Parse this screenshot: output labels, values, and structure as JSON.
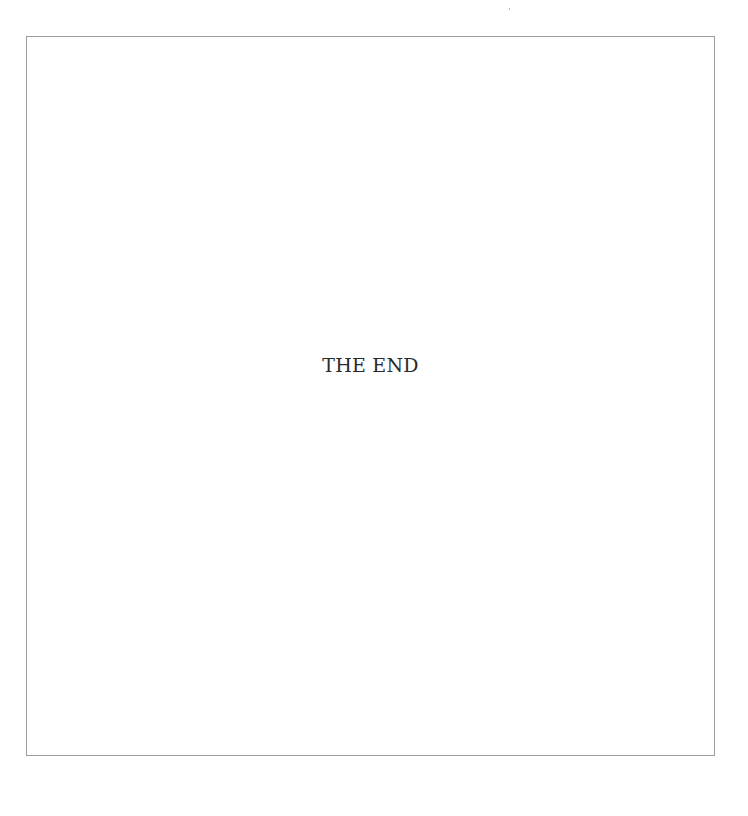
{
  "page": {
    "body_text": "THE END",
    "colors": {
      "background": "#ffffff",
      "frame_border": "#9c9c9c",
      "text": "#2a2a2a"
    }
  }
}
